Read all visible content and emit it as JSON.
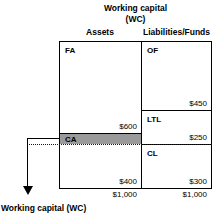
{
  "diagram": {
    "title_line1": "Working capital",
    "title_line2": "(WC)",
    "column_headers": {
      "assets": "Assets",
      "liabilities": "Liabilities/Funds"
    },
    "assets_column": {
      "fixed_assets": {
        "tag": "FA",
        "amount": "$600"
      },
      "current_assets": {
        "tag": "CA",
        "amount": "$400"
      },
      "total": "$1,000"
    },
    "liabilities_column": {
      "owners_funds": {
        "tag": "OF",
        "amount": "$450"
      },
      "long_term_liabilities": {
        "tag": "LTL",
        "amount": "$250"
      },
      "current_liabilities": {
        "tag": "CL",
        "amount": "$300"
      },
      "total": "$1,000"
    },
    "callout_label": "Working capital (WC)",
    "colors": {
      "highlight_fill": "#9a9a9a",
      "line": "#000000",
      "background": "#ffffff"
    }
  }
}
